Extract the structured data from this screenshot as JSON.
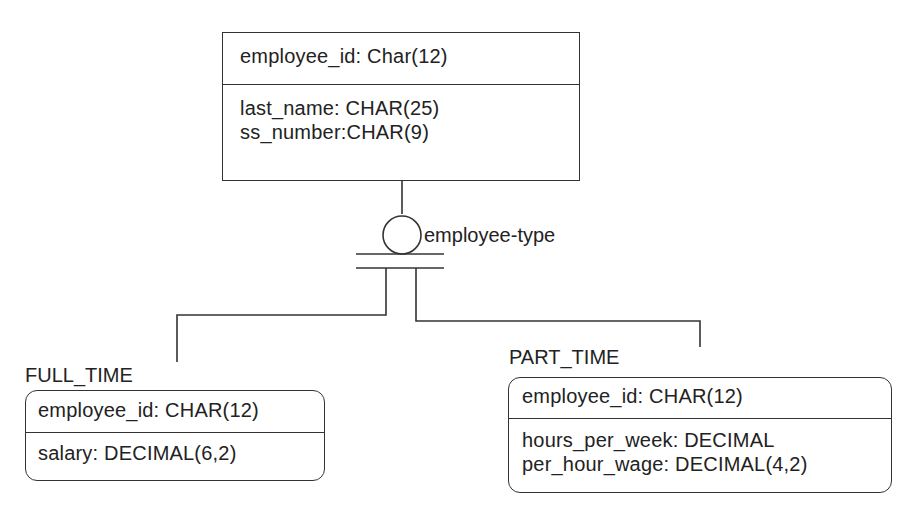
{
  "supertype": {
    "key_attribute": "employee_id: Char(12)",
    "attributes": [
      "last_name: CHAR(25)",
      "ss_number:CHAR(9)"
    ]
  },
  "discriminator": {
    "label": "employee-type"
  },
  "subtypes": [
    {
      "name": "FULL_TIME",
      "key_attribute": "employee_id: CHAR(12)",
      "attributes": [
        "salary: DECIMAL(6,2)"
      ]
    },
    {
      "name": "PART_TIME",
      "key_attribute": "employee_id: CHAR(12)",
      "attributes": [
        "hours_per_week: DECIMAL",
        "per_hour_wage: DECIMAL(4,2)"
      ]
    }
  ],
  "colors": {
    "line": "#333333",
    "text": "#222222",
    "background": "#ffffff"
  }
}
